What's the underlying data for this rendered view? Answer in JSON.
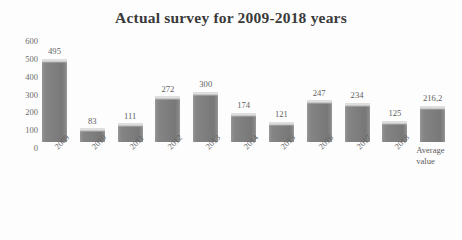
{
  "chart_data": {
    "type": "bar",
    "title": "Actual survey for 2009-2018 years",
    "xlabel": "",
    "ylabel": "",
    "ylim": [
      0,
      600
    ],
    "yticks": [
      600,
      500,
      400,
      300,
      200,
      100,
      0
    ],
    "grid": false,
    "legend": null,
    "categories": [
      "2009",
      "2010",
      "2011",
      "2012",
      "2013",
      "2014",
      "2015",
      "2016",
      "2017",
      "2018",
      "Average value"
    ],
    "category_lines": [
      [
        "2009"
      ],
      [
        "2010"
      ],
      [
        "2011"
      ],
      [
        "2012"
      ],
      [
        "2013"
      ],
      [
        "2014"
      ],
      [
        "2015"
      ],
      [
        "2016"
      ],
      [
        "2017"
      ],
      [
        "2018"
      ],
      [
        "Average",
        "value"
      ]
    ],
    "values": [
      495,
      83,
      111,
      272,
      300,
      174,
      121,
      247,
      234,
      125,
      216.2
    ],
    "value_labels": [
      "495",
      "83",
      "111",
      "272",
      "300",
      "174",
      "121",
      "247",
      "234",
      "125",
      "216,2"
    ],
    "series": [
      {
        "name": "Actual survey",
        "values": [
          495,
          83,
          111,
          272,
          300,
          174,
          121,
          247,
          234,
          125,
          216.2
        ],
        "color": "#808080"
      }
    ],
    "rotated_tick_count": 10,
    "colors": {
      "bar_fill": "#808080",
      "bar_highlight": "#dedede",
      "title_text": "#3a3a3a",
      "tick_text": "#6b6b6b",
      "value_text": "#5d5d5d",
      "background": "#fdfdfd"
    }
  }
}
